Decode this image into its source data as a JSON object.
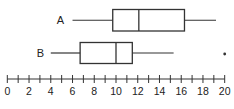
{
  "chart_data": {
    "type": "boxplot",
    "title": "",
    "xlabel": "",
    "ylabel": "",
    "xlim": [
      0,
      20
    ],
    "tick_labels": [
      "0",
      "2",
      "4",
      "6",
      "8",
      "10",
      "12",
      "14",
      "16",
      "18",
      "20"
    ],
    "minor_tick_step": 1,
    "grid": false,
    "legend": null,
    "series": [
      {
        "name": "A",
        "min": 6,
        "q1": 9.7,
        "median": 12.1,
        "q3": 16.3,
        "max": 19.2,
        "outliers": []
      },
      {
        "name": "B",
        "min": 4,
        "q1": 6.7,
        "median": 10,
        "q3": 11.5,
        "max": 15.3,
        "outliers": [
          20
        ]
      }
    ]
  },
  "labels": {
    "a": "A",
    "b": "B"
  },
  "colors": {
    "stroke": "#333333",
    "background": "#ffffff"
  }
}
